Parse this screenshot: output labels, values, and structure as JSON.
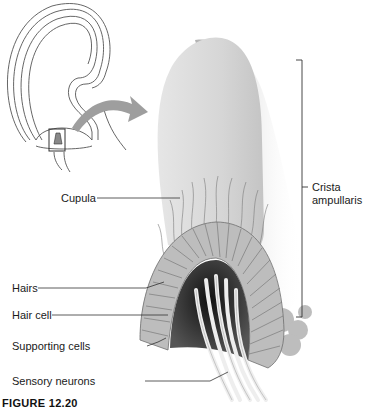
{
  "figure": {
    "caption": "FIGURE 12.20",
    "inset": {
      "name": "semicircular-canal-ampulla-overview"
    },
    "labels": {
      "cupula": "Cupula",
      "hairs": "Hairs",
      "hair_cell": "Hair cell",
      "supporting_cells": "Supporting cells",
      "sensory_neurons": "Sensory neurons",
      "crista_line1": "Crista",
      "crista_line2": "ampullaris"
    },
    "colors": {
      "cupula": "#d9d9d9",
      "shadow": "#9a9a9a",
      "cells": "#bdbdbd",
      "cell_outline": "#6e6e6e",
      "dark_core": "#2a2a2a",
      "neurons": "#f0f0f0",
      "line": "#333333"
    }
  }
}
